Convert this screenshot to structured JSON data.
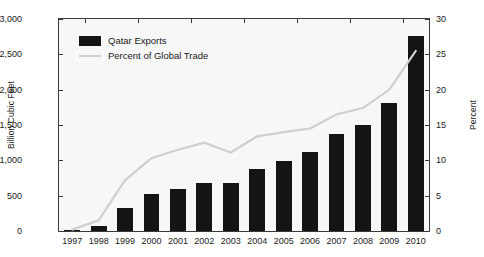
{
  "chart_data": {
    "type": "bar",
    "title": "",
    "xlabel": "",
    "ylabel": "Billion Cubic Feet",
    "y2label": "Percent",
    "ylim": [
      0,
      3000
    ],
    "y2lim": [
      0,
      30
    ],
    "yticks": [
      "0",
      "500",
      "1,000",
      "1,500",
      "2,000",
      "2,500",
      "3,000"
    ],
    "ytick_values": [
      0,
      500,
      1000,
      1500,
      2000,
      2500,
      3000
    ],
    "y2ticks": [
      "0",
      "5",
      "10",
      "15",
      "20",
      "25",
      "30"
    ],
    "y2tick_values": [
      0,
      5,
      10,
      15,
      20,
      25,
      30
    ],
    "grid": false,
    "legend_position": "top-left",
    "categories": [
      "1997",
      "1998",
      "1999",
      "2000",
      "2001",
      "2002",
      "2003",
      "2004",
      "2005",
      "2006",
      "2007",
      "2008",
      "2009",
      "2010"
    ],
    "series": [
      {
        "name": "Qatar Exports",
        "type": "bar",
        "axis": "left",
        "unit": "Billion Cubic Feet",
        "color": "#141414",
        "values": [
          15,
          75,
          320,
          520,
          600,
          685,
          680,
          875,
          990,
          1115,
          1370,
          1505,
          1810,
          2755
        ]
      },
      {
        "name": "Percent of Global Trade",
        "type": "line",
        "axis": "right",
        "unit": "Percent",
        "color": "#cfcfcf",
        "values": [
          0.2,
          1.5,
          7.2,
          10.3,
          11.5,
          12.5,
          11.1,
          13.4,
          14.0,
          14.5,
          16.5,
          17.4,
          20.0,
          25.5
        ]
      }
    ]
  },
  "legend": {
    "items": [
      {
        "label": "Qatar Exports",
        "marker": "bar-swatch"
      },
      {
        "label": "Percent of Global Trade",
        "marker": "line-swatch"
      }
    ]
  },
  "colors": {
    "bar": "#141414",
    "line": "#cfcfcf",
    "plot_background": "#f7f7f7",
    "axis": "#3a3a3a",
    "text": "#1a1a1a"
  }
}
